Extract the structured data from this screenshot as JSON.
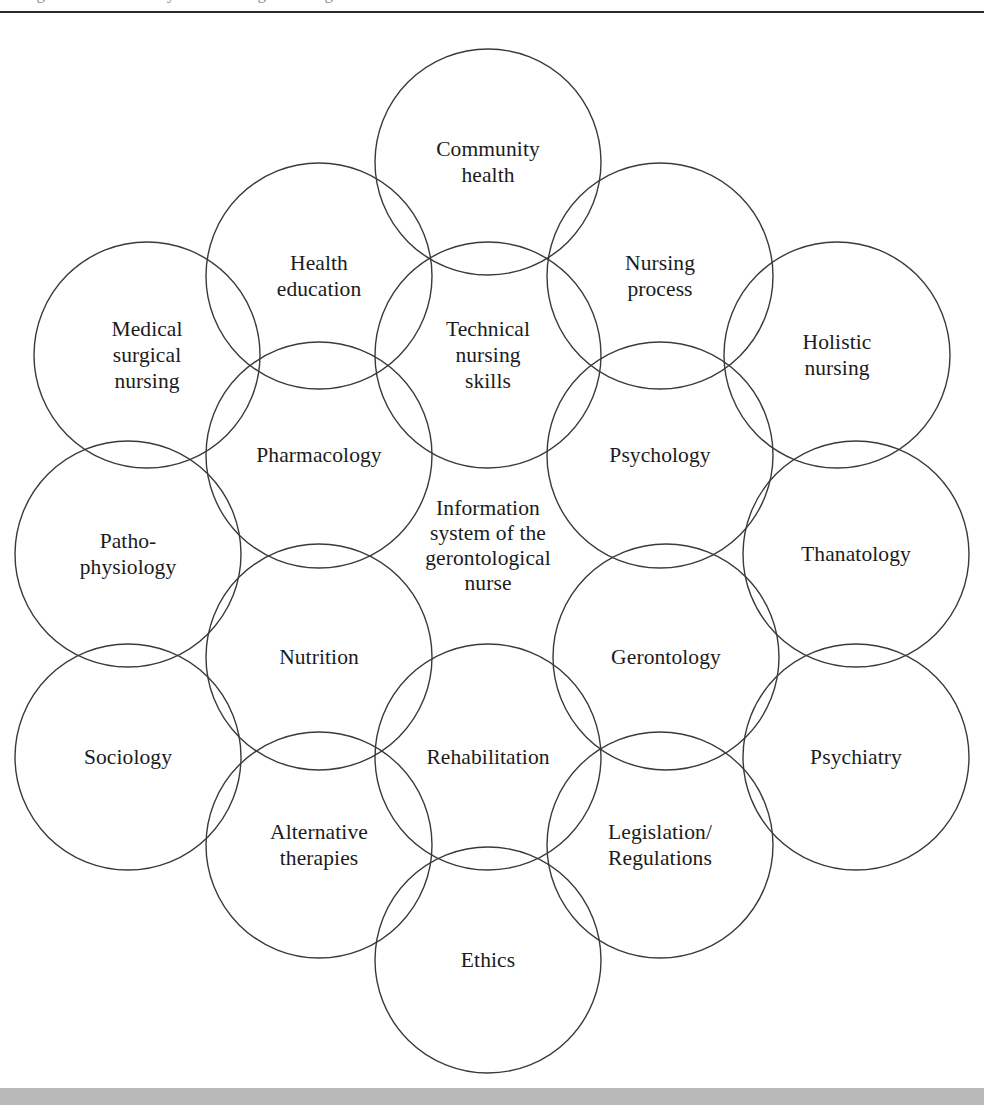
{
  "figure": {
    "title": "Information system of the gerontological nurse",
    "cropped_caption_remnant": "Figure  Information system of the gerontological nurse",
    "circle_stroke_color": "#3a3a3a",
    "background_color": "#ffffff",
    "footer_band_color": "#b9b9b9",
    "text_color": "#1b1b1b"
  },
  "center": {
    "label": "Information\nsystem of the\ngerontological\nnurse",
    "x": 488,
    "y": 532
  },
  "chart_data": {
    "type": "diagram",
    "subtype": "overlapping-circles-venn",
    "title": "Information system of the gerontological nurse",
    "center_label": "Information system of the gerontological nurse",
    "circle_radius": 113,
    "node_count": 18,
    "nodes": [
      {
        "label": "Community\nhealth",
        "plain": "Community health",
        "x": 488,
        "y": 148,
        "r": 113,
        "row": 1
      },
      {
        "label": "Health\neducation",
        "plain": "Health education",
        "x": 319,
        "y": 262,
        "r": 113,
        "row": 2
      },
      {
        "label": "Nursing\nprocess",
        "plain": "Nursing process",
        "x": 660,
        "y": 262,
        "r": 113,
        "row": 2
      },
      {
        "label": "Medical\nsurgical\nnursing",
        "plain": "Medical surgical nursing",
        "x": 147,
        "y": 341,
        "r": 113,
        "row": 3
      },
      {
        "label": "Technical\nnursing\nskills",
        "plain": "Technical nursing skills",
        "x": 488,
        "y": 341,
        "r": 113,
        "row": 3
      },
      {
        "label": "Holistic\nnursing",
        "plain": "Holistic nursing",
        "x": 837,
        "y": 341,
        "r": 113,
        "row": 3
      },
      {
        "label": "Pharmacology",
        "plain": "Pharmacology",
        "x": 319,
        "y": 441,
        "r": 113,
        "row": 4
      },
      {
        "label": "Psychology",
        "plain": "Psychology",
        "x": 660,
        "y": 441,
        "r": 113,
        "row": 4
      },
      {
        "label": "Patho-\nphysiology",
        "plain": "Pathophysiology",
        "x": 128,
        "y": 540,
        "r": 113,
        "row": 5
      },
      {
        "label": "Thanatology",
        "plain": "Thanatology",
        "x": 856,
        "y": 540,
        "r": 113,
        "row": 5
      },
      {
        "label": "Nutrition",
        "plain": "Nutrition",
        "x": 319,
        "y": 643,
        "r": 113,
        "row": 6
      },
      {
        "label": "Gerontology",
        "plain": "Gerontology",
        "x": 666,
        "y": 643,
        "r": 113,
        "row": 6
      },
      {
        "label": "Sociology",
        "plain": "Sociology",
        "x": 128,
        "y": 743,
        "r": 113,
        "row": 7
      },
      {
        "label": "Rehabilitation",
        "plain": "Rehabilitation",
        "x": 488,
        "y": 743,
        "r": 113,
        "row": 7
      },
      {
        "label": "Psychiatry",
        "plain": "Psychiatry",
        "x": 856,
        "y": 743,
        "r": 113,
        "row": 7
      },
      {
        "label": "Alternative\ntherapies",
        "plain": "Alternative therapies",
        "x": 319,
        "y": 831,
        "r": 113,
        "row": 8
      },
      {
        "label": "Legislation/\nRegulations",
        "plain": "Legislation/Regulations",
        "x": 660,
        "y": 831,
        "r": 113,
        "row": 8
      },
      {
        "label": "Ethics",
        "plain": "Ethics",
        "x": 488,
        "y": 946,
        "r": 113,
        "row": 9
      }
    ]
  }
}
